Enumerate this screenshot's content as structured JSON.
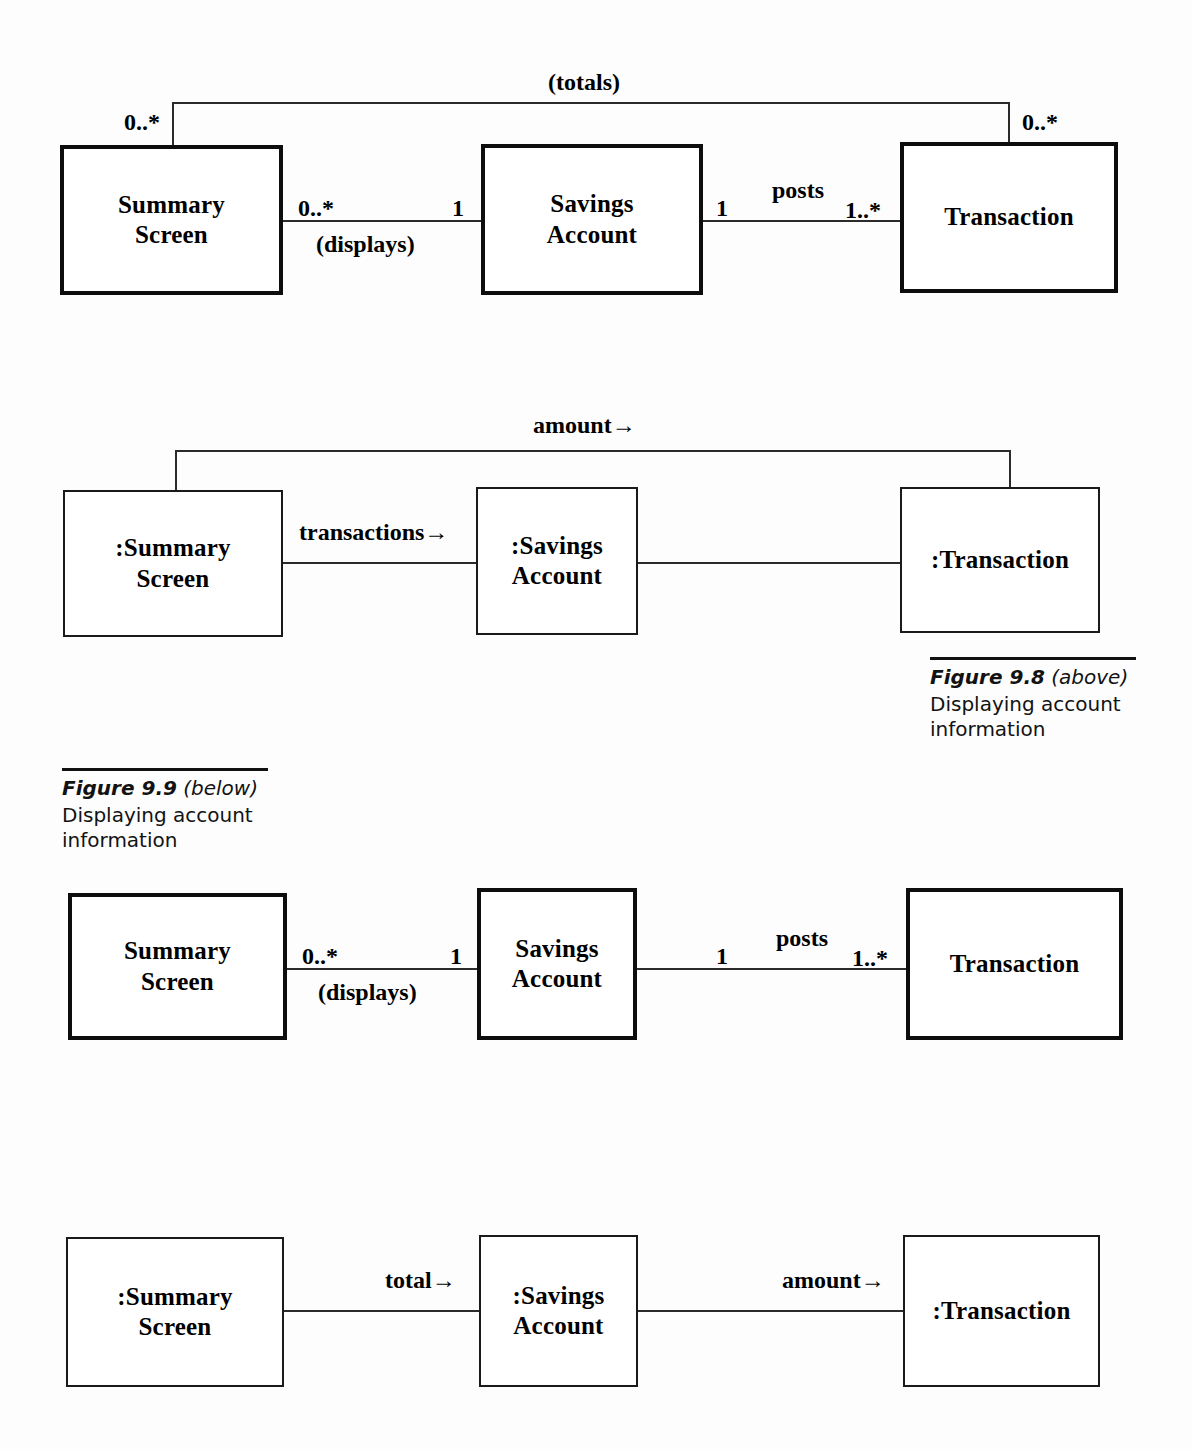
{
  "diagrams": [
    {
      "id": "class-diagram-totals",
      "kind": "uml-class-diagram",
      "boxes": [
        {
          "name": "summary-screen",
          "line1": "Summary",
          "line2": "Screen"
        },
        {
          "name": "savings-account",
          "line1": "Savings",
          "line2": "Account"
        },
        {
          "name": "transaction",
          "line1": "Transaction",
          "line2": ""
        }
      ],
      "associations": [
        {
          "name": "summary-screen-displays-savings-account",
          "label": "(displays)",
          "source_multiplicity": "0..*",
          "target_multiplicity": "1"
        },
        {
          "name": "savings-account-posts-transaction",
          "label": "posts",
          "source_multiplicity": "1",
          "target_multiplicity": "1..*"
        },
        {
          "name": "summary-screen-totals-transaction",
          "label": "(totals)",
          "source_multiplicity": "0..*",
          "target_multiplicity": "0..*"
        }
      ]
    },
    {
      "id": "object-diagram-amount",
      "kind": "uml-object-diagram",
      "boxes": [
        {
          "name": "summary-screen-object",
          "line1": ":Summary",
          "line2": "Screen"
        },
        {
          "name": "savings-account-object",
          "line1": ":Savings",
          "line2": "Account"
        },
        {
          "name": "transaction-object",
          "line1": ":Transaction",
          "line2": ""
        }
      ],
      "links": [
        {
          "name": "transactions-link",
          "label": "transactions→"
        },
        {
          "name": "savings-transaction-link",
          "label": ""
        },
        {
          "name": "amount-link",
          "label": "amount→"
        }
      ]
    },
    {
      "id": "class-diagram-displays-posts",
      "kind": "uml-class-diagram",
      "boxes": [
        {
          "name": "summary-screen",
          "line1": "Summary",
          "line2": "Screen"
        },
        {
          "name": "savings-account",
          "line1": "Savings",
          "line2": "Account"
        },
        {
          "name": "transaction",
          "line1": "Transaction",
          "line2": ""
        }
      ],
      "associations": [
        {
          "name": "summary-screen-displays-savings-account",
          "label": "(displays)",
          "source_multiplicity": "0..*",
          "target_multiplicity": "1"
        },
        {
          "name": "savings-account-posts-transaction",
          "label": "posts",
          "source_multiplicity": "1",
          "target_multiplicity": "1..*"
        }
      ]
    },
    {
      "id": "object-diagram-total-amount",
      "kind": "uml-object-diagram",
      "boxes": [
        {
          "name": "summary-screen-object",
          "line1": ":Summary",
          "line2": "Screen"
        },
        {
          "name": "savings-account-object",
          "line1": ":Savings",
          "line2": "Account"
        },
        {
          "name": "transaction-object",
          "line1": ":Transaction",
          "line2": ""
        }
      ],
      "links": [
        {
          "name": "total-link",
          "label": "total→"
        },
        {
          "name": "amount-link",
          "label": "amount→"
        }
      ]
    }
  ],
  "captions": [
    {
      "name": "figure-9-8-caption",
      "figure": "Figure 9.8",
      "position": " (above)",
      "body": "Displaying account information"
    },
    {
      "name": "figure-9-9-caption",
      "figure": "Figure 9.9",
      "position": " (below)",
      "body": "Displaying account information"
    }
  ]
}
